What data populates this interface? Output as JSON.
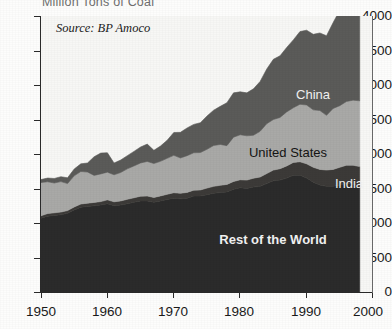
{
  "title": "Million Tons of Coal",
  "source_note": "Source: BP Amoco",
  "labels": {
    "china": "China",
    "united_states": "United States",
    "india": "India",
    "rest_of_world": "Rest of the World"
  },
  "colors": {
    "rest_of_world": "#2b2b2b",
    "india": "#3c3a38",
    "united_states": "#a9a9a7",
    "china": "#5b5b59",
    "plot_background": "#f7f7f5",
    "axis": "#2a2a2a",
    "title_text": "#6f6f6f"
  },
  "chart_data": {
    "type": "area",
    "title": "Million Tons of Coal",
    "subtitle": "Source: BP Amoco",
    "xlabel": "",
    "ylabel": "Million Tons of Coal",
    "xlim": [
      1950,
      2000
    ],
    "ylim": [
      0,
      4000
    ],
    "grid": false,
    "legend": "inline-band-labels",
    "stacked": true,
    "xticks": [
      1950,
      1960,
      1970,
      1980,
      1990,
      2000
    ],
    "xtick_labels": [
      "1950",
      "1960",
      "1970",
      "1980",
      "1990",
      "2000"
    ],
    "yticks": [
      0,
      500,
      1000,
      1500,
      2000,
      2500,
      3000,
      3500,
      4000
    ],
    "ytick_labels": [
      "0",
      "500",
      "1000",
      "1500",
      "2000",
      "2500",
      "3000",
      "3500",
      "4000"
    ],
    "x": [
      1950,
      1951,
      1952,
      1953,
      1954,
      1955,
      1956,
      1957,
      1958,
      1959,
      1960,
      1961,
      1962,
      1963,
      1964,
      1965,
      1966,
      1967,
      1968,
      1969,
      1970,
      1971,
      1972,
      1973,
      1974,
      1975,
      1976,
      1977,
      1978,
      1979,
      1980,
      1981,
      1982,
      1983,
      1984,
      1985,
      1986,
      1987,
      1988,
      1989,
      1990,
      1991,
      1992,
      1993,
      1994,
      1995,
      1996,
      1997,
      1998
    ],
    "series": [
      {
        "name": "Rest of the World",
        "color": "#2b2b2b",
        "values": [
          1080,
          1110,
          1120,
          1130,
          1150,
          1200,
          1240,
          1250,
          1260,
          1270,
          1290,
          1260,
          1270,
          1290,
          1310,
          1330,
          1330,
          1310,
          1330,
          1350,
          1370,
          1360,
          1370,
          1400,
          1400,
          1420,
          1440,
          1450,
          1460,
          1500,
          1520,
          1510,
          1530,
          1540,
          1580,
          1620,
          1630,
          1660,
          1700,
          1700,
          1660,
          1600,
          1560,
          1540,
          1540,
          1560,
          1580,
          1570,
          1540
        ]
      },
      {
        "name": "India",
        "color": "#3c3a38",
        "values": [
          35,
          37,
          38,
          39,
          40,
          42,
          45,
          47,
          48,
          50,
          55,
          57,
          60,
          63,
          65,
          68,
          70,
          70,
          72,
          75,
          78,
          80,
          83,
          85,
          88,
          95,
          100,
          105,
          108,
          110,
          115,
          120,
          128,
          135,
          145,
          155,
          165,
          175,
          185,
          195,
          205,
          215,
          225,
          235,
          245,
          255,
          265,
          275,
          285
        ]
      },
      {
        "name": "United States",
        "color": "#a9a9a7",
        "values": [
          480,
          460,
          430,
          440,
          390,
          450,
          470,
          450,
          390,
          400,
          400,
          390,
          410,
          440,
          460,
          480,
          500,
          490,
          500,
          520,
          540,
          510,
          530,
          540,
          540,
          560,
          590,
          590,
          560,
          640,
          650,
          640,
          620,
          660,
          720,
          730,
          740,
          780,
          790,
          830,
          850,
          830,
          850,
          790,
          880,
          890,
          920,
          940,
          950
        ]
      },
      {
        "name": "China",
        "color": "#5b5b59",
        "values": [
          43,
          53,
          66,
          70,
          84,
          98,
          110,
          130,
          270,
          300,
          280,
          170,
          180,
          190,
          210,
          230,
          250,
          190,
          220,
          260,
          330,
          370,
          400,
          410,
          430,
          480,
          510,
          550,
          620,
          640,
          620,
          620,
          670,
          720,
          790,
          870,
          890,
          930,
          980,
          1050,
          1080,
          1090,
          1120,
          1150,
          1240,
          1380,
          1400,
          1370,
          1270
        ]
      }
    ]
  }
}
